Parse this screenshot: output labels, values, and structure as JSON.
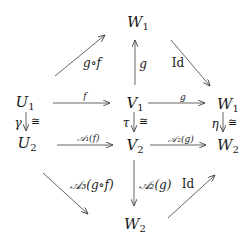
{
  "diagram": {
    "type": "commutative-diagram",
    "colors": {
      "ink": "#1a1a1a",
      "arrow": "#444444",
      "background": "#ffffff"
    },
    "nodes": {
      "w1_top": {
        "base": "W",
        "sub": "1"
      },
      "u1": {
        "base": "U",
        "sub": "1"
      },
      "v1": {
        "base": "V",
        "sub": "1"
      },
      "w1_right": {
        "base": "W",
        "sub": "1"
      },
      "u2": {
        "base": "U",
        "sub": "2"
      },
      "v2": {
        "base": "V",
        "sub": "2"
      },
      "w2_right": {
        "base": "W",
        "sub": "2"
      },
      "w2_bottom": {
        "base": "W",
        "sub": "2"
      }
    },
    "arrows": {
      "u1_to_w1_top": {
        "label": "g∘f"
      },
      "v1_to_w1_top": {
        "label": "g"
      },
      "w1_top_to_w1_right": {
        "label": "Id"
      },
      "u1_to_v1": {
        "label": "f"
      },
      "v1_to_w1_right": {
        "label": "g"
      },
      "u1_to_u2": {
        "label": "γ",
        "iso": "≅"
      },
      "v1_to_v2": {
        "label": "τ",
        "iso": "≅"
      },
      "w1_to_w2": {
        "label": "η",
        "iso": "≅"
      },
      "u2_to_v2": {
        "label": "𝒜₁(f)"
      },
      "v2_to_w2_right": {
        "label": "𝒜₂(g)"
      },
      "u2_to_w2_bottom": {
        "label": "𝒜₃(g∘f)"
      },
      "v2_to_w2_bottom": {
        "label": "𝒜₂(g)"
      },
      "w2_bottom_to_w2_right": {
        "label": "Id"
      }
    }
  }
}
